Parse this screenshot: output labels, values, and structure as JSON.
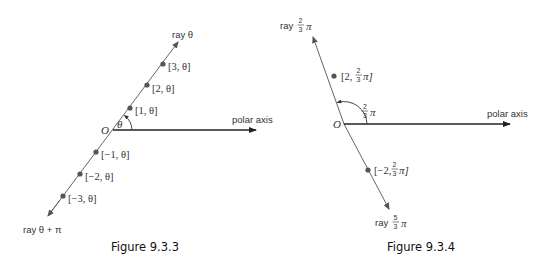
{
  "figures": [
    {
      "caption": "Figure 9.3.3",
      "origin_label": "O",
      "axis_label": "polar axis",
      "angle_label": "θ",
      "ray_forward_label": "ray θ",
      "ray_backward_label": "ray θ + π",
      "points": [
        {
          "r": 3,
          "label": "[3, θ]"
        },
        {
          "r": 2,
          "label": "[2, θ]"
        },
        {
          "r": 1,
          "label": "[1, θ]"
        },
        {
          "r": -1,
          "label": "[−1, θ]"
        },
        {
          "r": -2,
          "label": "[−2, θ]"
        },
        {
          "r": -3,
          "label": "[−3, θ]"
        }
      ]
    },
    {
      "caption": "Figure 9.3.4",
      "origin_label": "O",
      "axis_label": "polar axis",
      "angle_label": {
        "num": "2",
        "den": "3",
        "suffix": "π"
      },
      "ray_forward_label": {
        "prefix": "ray",
        "num": "2",
        "den": "3",
        "suffix": "π"
      },
      "ray_backward_label": {
        "prefix": "ray",
        "num": "5",
        "den": "3",
        "suffix": "π"
      },
      "points": [
        {
          "r": 2,
          "label_prefix": "[2, ",
          "num": "2",
          "den": "3",
          "label_suffix": "π]"
        },
        {
          "r": -2,
          "label_prefix": "[−2, ",
          "num": "2",
          "den": "3",
          "label_suffix": "π]"
        }
      ]
    }
  ],
  "colors": {
    "axis": "#222222",
    "ray": "#666666",
    "point": "#555555",
    "text": "#333333"
  }
}
